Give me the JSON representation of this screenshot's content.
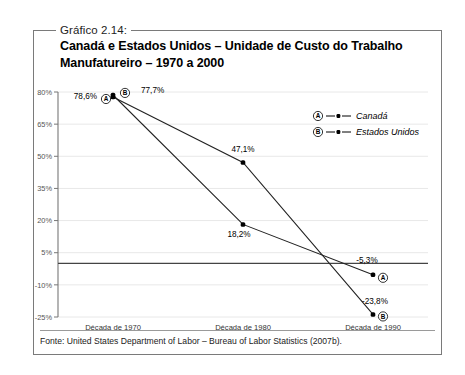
{
  "box": {
    "caption": "Gráfico 2.14:",
    "title": "Canadá e Estados Unidos – Unidade de Custo do Trabalho Manufatureiro – 1970 a 2000",
    "footer": "Fonte: United States Department of Labor – Bureau of Labor Statistics (2007b)."
  },
  "chart_data": {
    "type": "line",
    "title": "Canadá e Estados Unidos – Unidade de Custo do Trabalho Manufatureiro – 1970 a 2000",
    "subtitle": "",
    "xlabel": "",
    "ylabel": "",
    "categories": [
      "Década de 1970",
      "Década de 1980",
      "Década de 1990"
    ],
    "ylim": [
      -25,
      80
    ],
    "yticks": [
      80,
      65,
      50,
      35,
      20,
      5,
      -10,
      -25
    ],
    "ytick_labels": [
      "80%",
      "65%",
      "50%",
      "35%",
      "20%",
      "5%",
      "-10%",
      "-25%"
    ],
    "grid": true,
    "zero_line": true,
    "legend_position": "top-right",
    "series": [
      {
        "name": "Canadá",
        "badge": "A",
        "values": [
          78.6,
          18.2,
          -5.3
        ],
        "labels": [
          "78,6%",
          "18,2%",
          "-5,3%"
        ]
      },
      {
        "name": "Estados Unidos",
        "badge": "B",
        "values": [
          77.7,
          47.1,
          -23.8
        ],
        "labels": [
          "77,7%",
          "47,1%",
          "-23,8%"
        ]
      }
    ],
    "colors": {
      "line": "#222222",
      "marker": "#000000",
      "grid": "#e8e8e8",
      "axis": "#777777"
    }
  }
}
